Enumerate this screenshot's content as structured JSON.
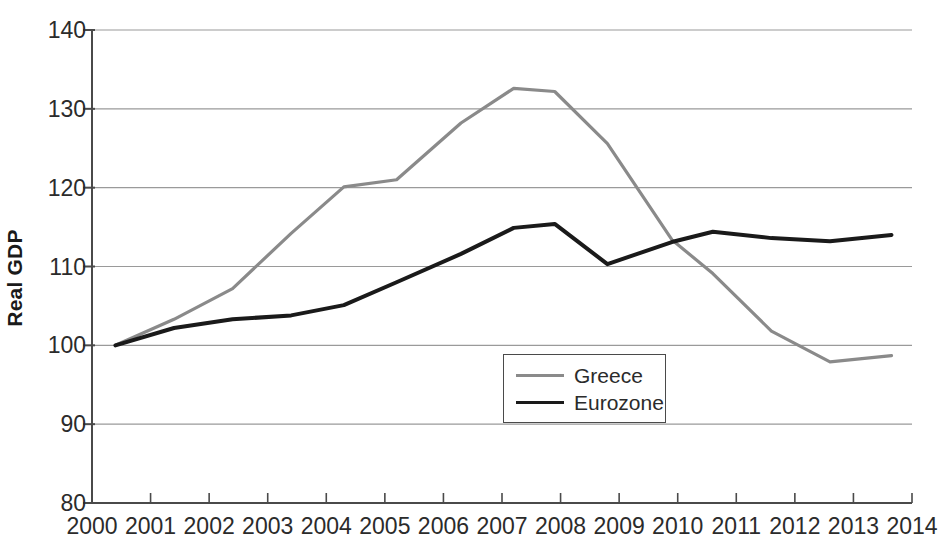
{
  "chart_data": {
    "type": "line",
    "title": "",
    "xlabel": "",
    "ylabel": "Real GDP",
    "xlim": [
      2000,
      2014
    ],
    "ylim": [
      80,
      140
    ],
    "xticks": [
      "2000",
      "2001",
      "2002",
      "2003",
      "2004",
      "2005",
      "2006",
      "2007",
      "2008",
      "2009",
      "2010",
      "2011",
      "2012",
      "2013",
      "2014"
    ],
    "yticks": [
      "80",
      "90",
      "100",
      "110",
      "120",
      "130",
      "140"
    ],
    "grid": true,
    "legend_position": "center",
    "series": [
      {
        "name": "Greece",
        "color": "#8a8a8a",
        "x": [
          2000.4,
          2001.4,
          2002.4,
          2003.4,
          2004.3,
          2005.2,
          2006.3,
          2007.2,
          2007.9,
          2008.8,
          2009.9,
          2010.6,
          2011.6,
          2012.6,
          2013.65
        ],
        "values": [
          100.0,
          103.3,
          107.2,
          114.2,
          120.1,
          121.0,
          128.2,
          132.6,
          132.2,
          125.6,
          113.4,
          109.1,
          101.8,
          97.9,
          98.7
        ]
      },
      {
        "name": "Eurozone",
        "color": "#1a1a1a",
        "x": [
          2000.4,
          2001.4,
          2002.4,
          2003.4,
          2004.3,
          2005.2,
          2006.3,
          2007.2,
          2007.9,
          2008.8,
          2009.9,
          2010.6,
          2011.6,
          2012.6,
          2013.65
        ],
        "values": [
          100.0,
          102.2,
          103.3,
          103.8,
          105.1,
          108.0,
          111.6,
          114.9,
          115.4,
          110.3,
          113.1,
          114.4,
          113.6,
          113.2,
          114.0
        ]
      }
    ]
  },
  "legend": {
    "items": [
      {
        "label": "Greece",
        "style": "greece"
      },
      {
        "label": "Eurozone",
        "style": "eurozone"
      }
    ]
  },
  "axes": {
    "y_title": "Real GDP"
  },
  "geometry": {
    "plot_left": 92,
    "plot_right": 912,
    "plot_top": 30,
    "plot_bottom": 503,
    "x_min": 2000,
    "x_max": 2014,
    "y_min": 80,
    "y_max": 140
  }
}
